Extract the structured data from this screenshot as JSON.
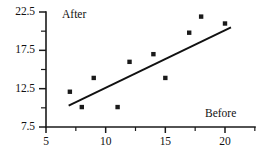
{
  "chart_data": {
    "type": "scatter",
    "title": "",
    "subtitle": "",
    "xlabel": "Before",
    "ylabel": "After",
    "xlim": [
      5,
      22.5
    ],
    "ylim": [
      7.5,
      22.5
    ],
    "grid": false,
    "legend": null,
    "x_ticks_major": [
      5,
      10,
      15,
      20
    ],
    "x_tick_labels": [
      "5",
      "10",
      "15",
      "20"
    ],
    "x_ticks_minor": [
      7.5,
      12.5,
      17.5,
      22.5
    ],
    "y_ticks_major": [
      7.5,
      12.5,
      17.5,
      22.5
    ],
    "y_tick_labels": [
      "7.5",
      "12.5",
      "17.5",
      "22.5"
    ],
    "y_ticks_minor": [
      10.0,
      15.0,
      20.0
    ],
    "points": [
      {
        "x": 7.0,
        "y": 12.1
      },
      {
        "x": 8.0,
        "y": 10.1
      },
      {
        "x": 9.0,
        "y": 13.9
      },
      {
        "x": 11.0,
        "y": 10.1
      },
      {
        "x": 12.0,
        "y": 16.0
      },
      {
        "x": 14.0,
        "y": 17.0
      },
      {
        "x": 15.0,
        "y": 13.9
      },
      {
        "x": 17.0,
        "y": 19.8
      },
      {
        "x": 18.0,
        "y": 21.9
      },
      {
        "x": 20.0,
        "y": 21.0
      }
    ],
    "fit_line": {
      "label": "",
      "x_start": 6.9,
      "y_start": 10.3,
      "x_end": 20.5,
      "y_end": 20.5
    },
    "marker_style": "filled-square",
    "marker_color": "#1a1a1a",
    "line_color": "#111111",
    "axis_color": "#1a1a1a"
  }
}
